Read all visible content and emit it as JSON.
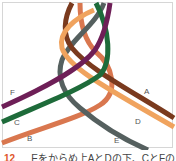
{
  "diagram": {
    "strands": [
      {
        "id": "A",
        "color": "#7a3a1e",
        "label": "A"
      },
      {
        "id": "B",
        "color": "#d9774f",
        "label": "B"
      },
      {
        "id": "C",
        "color": "#1e6b3a",
        "label": "C"
      },
      {
        "id": "D",
        "color": "#f0a35e",
        "label": "D"
      },
      {
        "id": "E",
        "color": "#55605f",
        "label": "E"
      },
      {
        "id": "F",
        "color": "#6e1f57",
        "label": "F"
      }
    ],
    "labels": {
      "A": "A",
      "B": "B",
      "C": "C",
      "D": "D",
      "E": "E",
      "F": "F"
    }
  },
  "caption": {
    "step_number": "12",
    "text": "Eをからめ上AとDの下、CとFの上、Bの下を"
  }
}
